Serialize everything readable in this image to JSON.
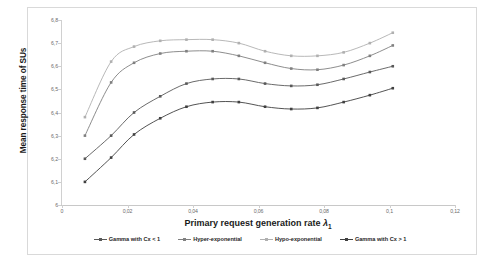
{
  "chart_data": {
    "type": "line",
    "title": "",
    "xlabel": "Primary request generation rate  λ₁",
    "ylabel": "Mean response time of SUs",
    "xlim": [
      0,
      0.12
    ],
    "ylim": [
      6,
      6.8
    ],
    "grid": false,
    "legend_position": "bottom",
    "x_ticks": [
      "0",
      "0,02",
      "0,04",
      "0,06",
      "0,08",
      "0,1",
      "0,12"
    ],
    "x_tick_values": [
      0,
      0.02,
      0.04,
      0.06,
      0.08,
      0.1,
      0.12
    ],
    "y_ticks": [
      "6",
      "6,1",
      "6,2",
      "6,3",
      "6,4",
      "6,5",
      "6,6",
      "6,7",
      "6,8"
    ],
    "y_tick_values": [
      6,
      6.1,
      6.2,
      6.3,
      6.4,
      6.5,
      6.6,
      6.7,
      6.8
    ],
    "x": [
      0.007,
      0.015,
      0.022,
      0.03,
      0.038,
      0.046,
      0.054,
      0.062,
      0.07,
      0.078,
      0.086,
      0.094,
      0.101
    ],
    "series": [
      {
        "name": "Hypo-exponential",
        "color": "#b0b0b0",
        "marker": "square",
        "values": [
          6.38,
          6.62,
          6.685,
          6.71,
          6.715,
          6.715,
          6.7,
          6.665,
          6.645,
          6.645,
          6.66,
          6.7,
          6.745
        ]
      },
      {
        "name": "Hyper-exponential",
        "color": "#808080",
        "marker": "square",
        "values": [
          6.3,
          6.53,
          6.615,
          6.655,
          6.665,
          6.665,
          6.645,
          6.615,
          6.59,
          6.585,
          6.605,
          6.645,
          6.69
        ]
      },
      {
        "name": "Gamma with Cx < 1",
        "color": "#595959",
        "marker": "square",
        "values": [
          6.2,
          6.3,
          6.4,
          6.47,
          6.525,
          6.545,
          6.545,
          6.525,
          6.515,
          6.52,
          6.545,
          6.575,
          6.6
        ]
      },
      {
        "name": "Gamma with Cx > 1",
        "color": "#404040",
        "marker": "square",
        "values": [
          6.1,
          6.205,
          6.305,
          6.375,
          6.425,
          6.445,
          6.445,
          6.425,
          6.415,
          6.42,
          6.445,
          6.475,
          6.505
        ]
      }
    ]
  },
  "legend": {
    "items": [
      {
        "label": "Gamma with Cx < 1",
        "color": "#595959"
      },
      {
        "label": "Hyper-exponential",
        "color": "#808080"
      },
      {
        "label": "Hypo-exponential",
        "color": "#b0b0b0"
      },
      {
        "label": "Gamma with Cx > 1",
        "color": "#404040"
      }
    ]
  },
  "axes": {
    "x_title_main": "Primary request generation rate",
    "x_title_symbol": "λ",
    "x_title_subscript": "1",
    "y_title": "Mean response time of SUs"
  }
}
